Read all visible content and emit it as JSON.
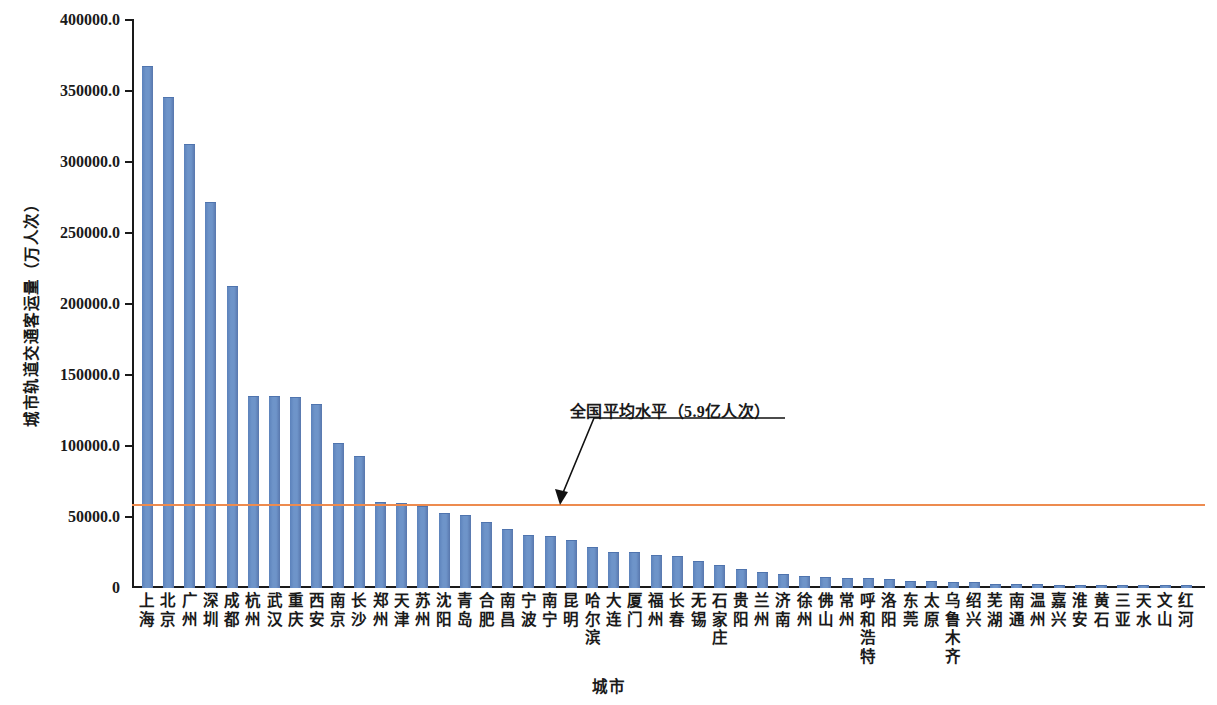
{
  "chart_data": {
    "type": "bar",
    "title": "",
    "xlabel": "城市",
    "ylabel": "城市轨道交通客运量（万人次）",
    "ylim": [
      0,
      400000
    ],
    "ytick_labels": [
      "400000.0",
      "350000.0",
      "300000.0",
      "250000.0",
      "200000.0",
      "150000.0",
      "100000.0",
      "50000.0",
      "0"
    ],
    "ytick_values": [
      400000,
      350000,
      300000,
      250000,
      200000,
      150000,
      100000,
      50000,
      0
    ],
    "grid": false,
    "legend": "none",
    "bar_color": "#6e94c9",
    "reference_line": {
      "value": 59000,
      "color": "#ed8b4f",
      "label": "全国平均水平（5.9亿人次）"
    },
    "categories": [
      "上海",
      "北京",
      "广州",
      "深圳",
      "成都",
      "杭州",
      "武汉",
      "重庆",
      "西安",
      "南京",
      "长沙",
      "郑州",
      "天津",
      "苏州",
      "沈阳",
      "青岛",
      "合肥",
      "南昌",
      "宁波",
      "南宁",
      "昆明",
      "哈尔滨",
      "大连",
      "厦门",
      "福州",
      "长春",
      "无锡",
      "石家庄",
      "贵阳",
      "兰州",
      "济南",
      "徐州",
      "佛山",
      "常州",
      "呼和浩特",
      "洛阳",
      "东莞",
      "太原",
      "乌鲁木齐",
      "绍兴",
      "芜湖",
      "南通",
      "温州",
      "嘉兴",
      "淮安",
      "黄石",
      "三亚",
      "天水",
      "文山",
      "红河"
    ],
    "values": [
      367000,
      345000,
      312000,
      271000,
      212000,
      134500,
      134500,
      134000,
      129000,
      101500,
      92000,
      60000,
      59000,
      57000,
      52000,
      51000,
      46000,
      41000,
      36500,
      36000,
      33000,
      28000,
      24500,
      25000,
      22500,
      21500,
      18500,
      15500,
      12500,
      10500,
      9500,
      8000,
      7000,
      6500,
      6000,
      5500,
      4500,
      4000,
      3800,
      3600,
      2200,
      2000,
      1800,
      1600,
      1400,
      1200,
      1000,
      900,
      800,
      700
    ]
  },
  "axis": {
    "y_title": "城市轨道交通客运量（万人次）",
    "x_title": "城市"
  },
  "annotation": {
    "text": "全国平均水平（5.9亿人次）"
  }
}
